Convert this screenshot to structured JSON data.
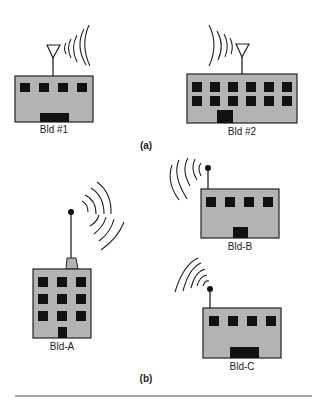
{
  "colors": {
    "building_fill": "#b3b3b3",
    "outline": "#222222",
    "window": "#111111"
  },
  "panel_a": {
    "caption": "(a)",
    "buildings": [
      {
        "label": "Bld #1",
        "antenna": "triangle",
        "windows": "4x1"
      },
      {
        "label": "Bld #2",
        "antenna": "triangle",
        "windows": "6x2"
      }
    ]
  },
  "panel_b": {
    "caption": "(b)",
    "buildings": [
      {
        "label": "Bld-A",
        "antenna": "ball-mast",
        "windows": "3x3"
      },
      {
        "label": "Bld-B",
        "antenna": "ball-mast",
        "windows": "4x1"
      },
      {
        "label": "Bld-C",
        "antenna": "ball-mast",
        "windows": "4x1"
      }
    ]
  }
}
